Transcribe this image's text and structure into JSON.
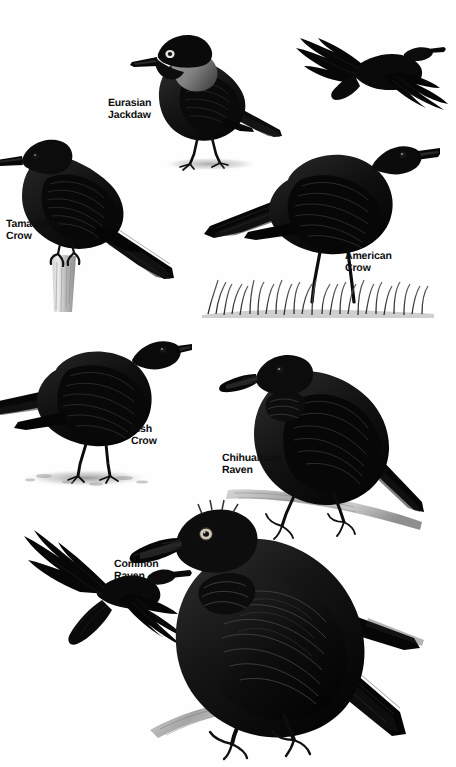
{
  "plate": {
    "title": "Crows and Ravens",
    "background_color": "#ffffff",
    "ink_color": "#000000",
    "label_color": "#0d0d0d",
    "width": 456,
    "height": 767
  },
  "labels": {
    "eurasian_jackdaw": "Eurasian\nJackdaw",
    "tamaulipas_crow": "Tamaulipas\nCrow",
    "american_crow": "American\nCrow",
    "fish_crow": "Fish\nCrow",
    "chihuahuan_raven": "Chihuahuan\nRaven",
    "common_raven": "Common\nRaven"
  },
  "figures": [
    {
      "id": "eurasian-jackdaw",
      "species": "Eurasian Jackdaw",
      "pose": "perched standing on ground, facing left",
      "features": "gray nape and hindneck, pale whitish iris, black cap, short stout bill",
      "has_shadow": true
    },
    {
      "id": "crow-flight",
      "species": "American Crow",
      "pose": "in flight, wings spread, viewed from below",
      "features": "fan-shaped squared tail, fingered primaries, all black",
      "has_shadow": false
    },
    {
      "id": "tamaulipas-crow",
      "species": "Tamaulipas Crow",
      "pose": "perched on weathered wooden post, facing left",
      "features": "small glossy crow, long tail, slender bill",
      "has_shadow": false
    },
    {
      "id": "american-crow",
      "species": "American Crow",
      "pose": "standing in grass, facing right",
      "features": "heavy straight bill, squared tail, long legs",
      "has_shadow": false
    },
    {
      "id": "fish-crow",
      "species": "Fish Crow",
      "pose": "standing on bare ground, facing right",
      "features": "smaller, slimmer bill, compact body, short legs",
      "has_shadow": true
    },
    {
      "id": "chihuahuan-raven",
      "species": "Chihuahuan Raven",
      "pose": "perched on pale branch, facing left",
      "features": "shaggy throat hackles, heavy bill, nasal bristles reaching far onto bill",
      "has_shadow": false
    },
    {
      "id": "raven-flight",
      "species": "Common Raven",
      "pose": "in flight, wings spread, wedge-shaped tail",
      "features": "wedge tail, long fingered wings, heavy head and bill",
      "has_shadow": false
    },
    {
      "id": "common-raven",
      "species": "Common Raven",
      "pose": "perched on branch, facing left, large",
      "features": "massive bill, shaggy throat hackles, pale eye ring, long wedge tail",
      "has_shadow": false
    }
  ]
}
